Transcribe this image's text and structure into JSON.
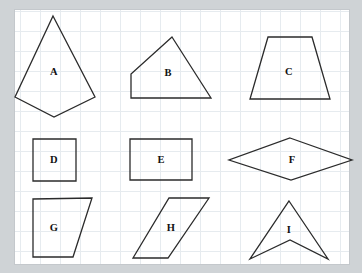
{
  "worksheet": {
    "title": "Polygon identification worksheet",
    "background_color": "#cfd3d6",
    "page_color": "#ffffff",
    "grid_color": "#e6ebef",
    "stroke_color": "#2b2b2b",
    "label_color": "#111111",
    "grid_spacing": 20
  },
  "shapes": [
    {
      "label": "A",
      "name": "kite",
      "sides": 4,
      "points": "53,16 95,97 54,117 15,97",
      "label_x": 54,
      "label_y": 72
    },
    {
      "label": "B",
      "name": "quadrilateral",
      "sides": 4,
      "points": "172,37 211,98 131,98 131,74",
      "label_x": 168,
      "label_y": 73
    },
    {
      "label": "C",
      "name": "trapezoid",
      "sides": 4,
      "points": "268,37 312,37 330,99 250,99",
      "label_x": 289,
      "label_y": 72
    },
    {
      "label": "D",
      "name": "square",
      "sides": 4,
      "points": "33,139 76,139 76,181 33,181",
      "label_x": 54,
      "label_y": 160
    },
    {
      "label": "E",
      "name": "rectangle",
      "sides": 4,
      "points": "130,139 192,139 192,180 130,180",
      "label_x": 161,
      "label_y": 160
    },
    {
      "label": "F",
      "name": "rhombus",
      "sides": 4,
      "points": "290,138 352,160 291,180 229,160",
      "label_x": 292,
      "label_y": 160
    },
    {
      "label": "G",
      "name": "right-trapezoid",
      "sides": 4,
      "points": "33,199 92,198 73,257 33,257",
      "label_x": 54,
      "label_y": 228
    },
    {
      "label": "H",
      "name": "parallelogram",
      "sides": 4,
      "points": "169,198 209,198 168,258 133,258",
      "label_x": 171,
      "label_y": 228
    },
    {
      "label": "I",
      "name": "arrowhead-concave-quadrilateral",
      "sides": 4,
      "points": "289,201 328,259 290,240 250,259",
      "label_x": 289,
      "label_y": 230
    }
  ]
}
